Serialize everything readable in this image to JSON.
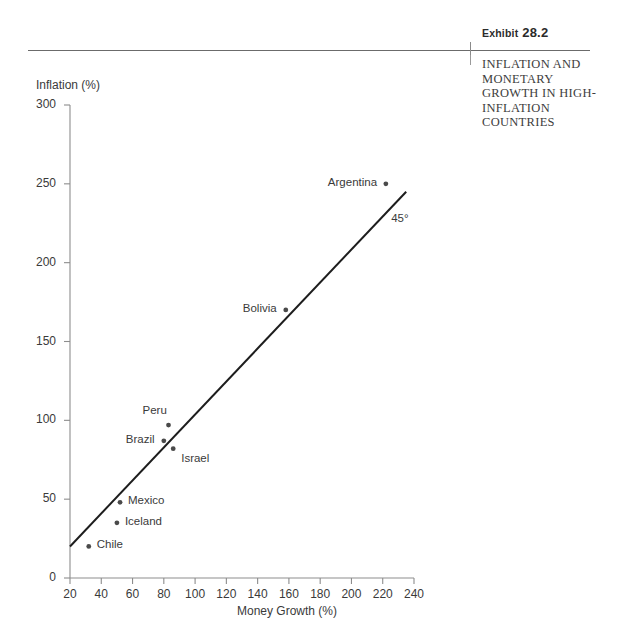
{
  "header": {
    "exhibit_label": "Exhibit",
    "exhibit_number": "28.2",
    "exhibit_title": "INFLATION AND MONETARY GROWTH IN HIGH-INFLATION COUNTRIES"
  },
  "chart_data": {
    "type": "scatter",
    "title": "INFLATION AND MONETARY GROWTH IN HIGH-INFLATION COUNTRIES",
    "xlabel": "Money Growth (%)",
    "ylabel": "Inflation (%)",
    "xlim": [
      20,
      240
    ],
    "ylim": [
      0,
      300
    ],
    "xticks": [
      "20",
      "40",
      "60",
      "80",
      "100",
      "120",
      "140",
      "160",
      "180",
      "200",
      "220",
      "240"
    ],
    "yticks": [
      "0",
      "50",
      "100",
      "150",
      "200",
      "250",
      "300"
    ],
    "grid": false,
    "legend": null,
    "points": [
      {
        "label": "Chile",
        "x": 32,
        "y": 20,
        "label_pos": "right"
      },
      {
        "label": "Iceland",
        "x": 50,
        "y": 35,
        "label_pos": "right"
      },
      {
        "label": "Mexico",
        "x": 52,
        "y": 48,
        "label_pos": "right"
      },
      {
        "label": "Brazil",
        "x": 80,
        "y": 87,
        "label_pos": "left"
      },
      {
        "label": "Peru",
        "x": 83,
        "y": 97,
        "label_pos": "above-left"
      },
      {
        "label": "Israel",
        "x": 86,
        "y": 82,
        "label_pos": "below-right"
      },
      {
        "label": "Bolivia",
        "x": 158,
        "y": 170,
        "label_pos": "left"
      },
      {
        "label": "Argentina",
        "x": 222,
        "y": 250,
        "label_pos": "left"
      }
    ],
    "reference_line": {
      "label": "45°",
      "x_start": 20,
      "y_start": 20,
      "x_end": 235,
      "y_end": 245
    }
  }
}
